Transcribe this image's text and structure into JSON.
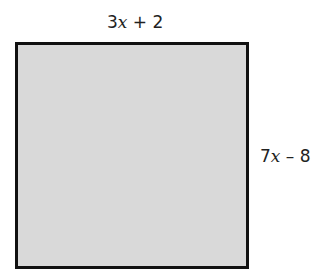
{
  "diagram": {
    "shape": "square",
    "fill_color": "#d9d9d9",
    "border_color": "#111111",
    "top_side": {
      "coefficient": "3",
      "variable": "x",
      "rest": " + 2",
      "full": "3x + 2"
    },
    "right_side": {
      "coefficient": "7",
      "variable": "x",
      "rest": " – 8",
      "full": "7x – 8"
    }
  }
}
